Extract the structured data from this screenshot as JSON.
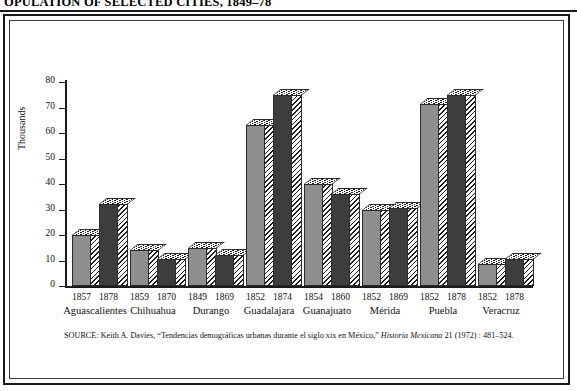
{
  "figure": {
    "title": "OPULATION OF SELECTED CITIES, 1849–78",
    "y_axis_title": "Thousands",
    "source_prefix": "SOURCE:",
    "source_text_1": " Keith A. Davies, “Tendencias demográficas urbanas durante el siglo xix en México,” ",
    "source_italic": "Historia Mexicana",
    "source_text_2": " 21 (1972) : 481–524."
  },
  "chart_data": {
    "type": "bar",
    "title": "OPULATION OF SELECTED CITIES, 1849–78",
    "xlabel": "",
    "ylabel": "Thousands",
    "ylim": [
      0,
      80
    ],
    "yticks": [
      0,
      10,
      20,
      30,
      40,
      50,
      60,
      70,
      80
    ],
    "ytick_labels": [
      "0",
      "10",
      "20",
      "30",
      "40",
      "50",
      "60",
      "70",
      "80"
    ],
    "grid": false,
    "legend": "none",
    "categories": [
      "Aguascalientes",
      "Chihuahua",
      "Durango",
      "Guadalajara",
      "Guanajuato",
      "Mérida",
      "Puebla",
      "Veracruz"
    ],
    "groups": [
      {
        "city": "Aguascalientes",
        "bars": [
          {
            "year": "1857",
            "value": 20.0,
            "shade": "light"
          },
          {
            "year": "1878",
            "value": 32.0,
            "shade": "dark"
          }
        ]
      },
      {
        "city": "Chihuahua",
        "bars": [
          {
            "year": "1859",
            "value": 14.0,
            "shade": "light"
          },
          {
            "year": "1870",
            "value": 10.5,
            "shade": "dark"
          }
        ]
      },
      {
        "city": "Durango",
        "bars": [
          {
            "year": "1849",
            "value": 15.0,
            "shade": "light"
          },
          {
            "year": "1869",
            "value": 12.0,
            "shade": "dark"
          }
        ]
      },
      {
        "city": "Guadalajara",
        "bars": [
          {
            "year": "1852",
            "value": 63.0,
            "shade": "light"
          },
          {
            "year": "1874",
            "value": 75.0,
            "shade": "dark"
          }
        ]
      },
      {
        "city": "Guanajuato",
        "bars": [
          {
            "year": "1854",
            "value": 40.0,
            "shade": "light"
          },
          {
            "year": "1860",
            "value": 36.0,
            "shade": "dark"
          }
        ]
      },
      {
        "city": "Mérida",
        "bars": [
          {
            "year": "1852",
            "value": 30.0,
            "shade": "light"
          },
          {
            "year": "1869",
            "value": 30.5,
            "shade": "dark"
          }
        ]
      },
      {
        "city": "Puebla",
        "bars": [
          {
            "year": "1852",
            "value": 71.5,
            "shade": "light"
          },
          {
            "year": "1878",
            "value": 75.0,
            "shade": "dark"
          }
        ]
      },
      {
        "city": "Veracruz",
        "bars": [
          {
            "year": "1852",
            "value": 8.5,
            "shade": "light"
          },
          {
            "year": "1878",
            "value": 10.5,
            "shade": "dark"
          }
        ]
      }
    ],
    "colors": {
      "light_bar": "#8e8e8e",
      "dark_bar": "#3d3d3d",
      "hatch": "#1f1f1f",
      "axis": "#1a1a1a",
      "background": "#ffffff"
    }
  }
}
